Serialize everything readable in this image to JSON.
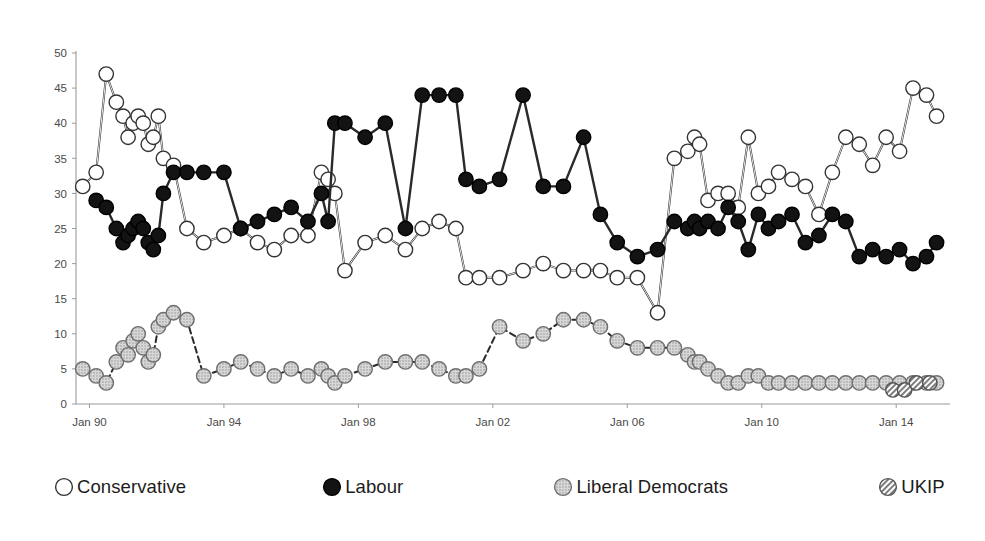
{
  "chart_data": {
    "type": "line",
    "title": "",
    "subtitle": "",
    "xlabel": "",
    "ylabel": "",
    "ylim": [
      0,
      50
    ],
    "yticks": [
      0,
      5,
      10,
      15,
      20,
      25,
      30,
      35,
      40,
      45,
      50
    ],
    "xticks": [
      "Jan 90",
      "Jan 94",
      "Jan 98",
      "Jan 02",
      "Jan 06",
      "Jan 10",
      "Jan 14"
    ],
    "xtick_values": [
      1990.0,
      1994.0,
      1998.0,
      2002.0,
      2006.0,
      2010.0,
      2014.0
    ],
    "xlim": [
      1989.6,
      2015.6
    ],
    "grid": false,
    "legend_position": "bottom",
    "markers": "circles",
    "series": [
      {
        "name": "Conservative",
        "color": "#ffffff",
        "marker": "open-circle",
        "line_style": "solid",
        "x": [
          1989.8,
          1990.2,
          1990.5,
          1990.8,
          1991.0,
          1991.15,
          1991.3,
          1991.45,
          1991.6,
          1991.75,
          1991.9,
          1992.05,
          1992.2,
          1992.5,
          1992.9,
          1993.4,
          1994.0,
          1994.5,
          1995.0,
          1995.5,
          1996.0,
          1996.5,
          1996.9,
          1997.1,
          1997.3,
          1997.6,
          1998.2,
          1998.8,
          1999.4,
          1999.9,
          2000.4,
          2000.9,
          2001.2,
          2001.6,
          2002.2,
          2002.9,
          2003.5,
          2004.1,
          2004.7,
          2005.2,
          2005.7,
          2006.3,
          2006.9,
          2007.4,
          2007.8,
          2008.0,
          2008.15,
          2008.4,
          2008.7,
          2009.0,
          2009.3,
          2009.6,
          2009.9,
          2010.2,
          2010.5,
          2010.9,
          2011.3,
          2011.7,
          2012.1,
          2012.5,
          2012.9,
          2013.3,
          2013.7,
          2014.1,
          2014.5,
          2014.9,
          2015.2
        ],
        "y": [
          31,
          33,
          47,
          43,
          41,
          38,
          40,
          41,
          40,
          37,
          38,
          41,
          35,
          34,
          25,
          23,
          24,
          25,
          23,
          22,
          24,
          24,
          33,
          32,
          30,
          19,
          23,
          24,
          22,
          25,
          26,
          25,
          18,
          18,
          18,
          19,
          20,
          19,
          19,
          19,
          18,
          18,
          13,
          35,
          36,
          38,
          37,
          29,
          30,
          30,
          28,
          38,
          30,
          31,
          33,
          32,
          31,
          27,
          33,
          38,
          37,
          34,
          38,
          36,
          45,
          44,
          41
        ],
        "note": "Conservative voting intention (%)"
      },
      {
        "name": "Labour",
        "color": "#111111",
        "marker": "filled-circle",
        "line_style": "solid",
        "x": [
          1990.2,
          1990.5,
          1990.8,
          1991.0,
          1991.15,
          1991.3,
          1991.45,
          1991.6,
          1991.75,
          1991.9,
          1992.05,
          1992.2,
          1992.5,
          1992.9,
          1993.4,
          1994.0,
          1994.5,
          1995.0,
          1995.5,
          1996.0,
          1996.5,
          1996.9,
          1997.1,
          1997.3,
          1997.6,
          1998.2,
          1998.8,
          1999.4,
          1999.9,
          2000.4,
          2000.9,
          2001.2,
          2001.6,
          2002.2,
          2002.9,
          2003.5,
          2004.1,
          2004.7,
          2005.2,
          2005.7,
          2006.3,
          2006.9,
          2007.4,
          2007.8,
          2008.0,
          2008.15,
          2008.4,
          2008.7,
          2009.0,
          2009.3,
          2009.6,
          2009.9,
          2010.2,
          2010.5,
          2010.9,
          2011.3,
          2011.7,
          2012.1,
          2012.5,
          2012.9,
          2013.3,
          2013.7,
          2014.1,
          2014.5,
          2014.9,
          2015.2
        ],
        "y": [
          29,
          28,
          25,
          23,
          24,
          25,
          26,
          25,
          23,
          22,
          24,
          30,
          33,
          33,
          33,
          33,
          25,
          26,
          27,
          28,
          26,
          30,
          26,
          40,
          40,
          38,
          40,
          25,
          44,
          44,
          44,
          32,
          31,
          32,
          44,
          31,
          31,
          38,
          27,
          23,
          21,
          22,
          26,
          25,
          26,
          25,
          26,
          25,
          28,
          26,
          22,
          27,
          25,
          26,
          27,
          23,
          24,
          27,
          26,
          21,
          22,
          21,
          22,
          20,
          21,
          23
        ],
        "note": "Labour voting intention (%)"
      },
      {
        "name": "Liberal Democrats",
        "color": "#c4c4c4",
        "marker": "dotted-circle",
        "line_style": "dashed",
        "x": [
          1989.8,
          1990.2,
          1990.5,
          1990.8,
          1991.0,
          1991.15,
          1991.3,
          1991.45,
          1991.6,
          1991.75,
          1991.9,
          1992.05,
          1992.2,
          1992.5,
          1992.9,
          1993.4,
          1994.0,
          1994.5,
          1995.0,
          1995.5,
          1996.0,
          1996.5,
          1996.9,
          1997.1,
          1997.3,
          1997.6,
          1998.2,
          1998.8,
          1999.4,
          1999.9,
          2000.4,
          2000.9,
          2001.2,
          2001.6,
          2002.2,
          2002.9,
          2003.5,
          2004.1,
          2004.7,
          2005.2,
          2005.7,
          2006.3,
          2006.9,
          2007.4,
          2007.8,
          2008.0,
          2008.15,
          2008.4,
          2008.7,
          2009.0,
          2009.3,
          2009.6,
          2009.9,
          2010.2,
          2010.5,
          2010.9,
          2011.3,
          2011.7,
          2012.1,
          2012.5,
          2012.9,
          2013.3,
          2013.7,
          2014.1,
          2014.5,
          2014.9,
          2015.2
        ],
        "y": [
          5,
          4,
          3,
          6,
          8,
          7,
          9,
          10,
          8,
          6,
          7,
          11,
          12,
          13,
          12,
          4,
          5,
          6,
          5,
          4,
          5,
          4,
          5,
          4,
          3,
          4,
          5,
          6,
          6,
          6,
          5,
          4,
          4,
          5,
          11,
          9,
          10,
          12,
          12,
          11,
          9,
          8,
          8,
          8,
          7,
          6,
          6,
          5,
          4,
          3,
          3,
          4,
          4,
          3,
          3,
          3,
          3,
          3,
          3,
          3,
          3,
          3,
          3,
          3,
          3,
          3,
          3
        ],
        "note": "Liberal Democrat voting intention (%)"
      },
      {
        "name": "UKIP",
        "color": "#d9d9d9",
        "marker": "hatched-circle",
        "line_style": "none",
        "x": [
          2013.9,
          2014.25,
          2014.6,
          2015.0
        ],
        "y": [
          2,
          2,
          3,
          3
        ],
        "note": "UKIP voting intention (%)"
      }
    ]
  },
  "legend": {
    "items": [
      {
        "label": "Conservative",
        "marker": "open-circle"
      },
      {
        "label": "Labour",
        "marker": "filled-circle"
      },
      {
        "label": "Liberal Democrats",
        "marker": "dotted-circle"
      },
      {
        "label": "UKIP",
        "marker": "hatched-circle"
      }
    ]
  },
  "colors": {
    "conservative": "#ffffff",
    "labour": "#111111",
    "liberal_democrats": "#c4c4c4",
    "ukip": "#d9d9d9",
    "axis": "#9a9a9a",
    "text": "#4a4a4a",
    "background": "#ffffff"
  }
}
